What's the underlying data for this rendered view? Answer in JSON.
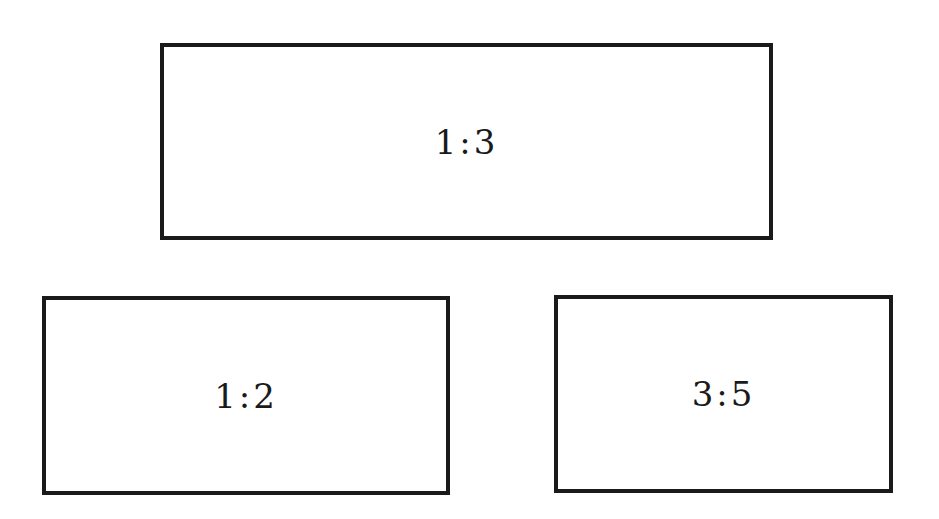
{
  "diagram": {
    "rectangles": [
      {
        "id": "ratio-1-3",
        "label": "1:3",
        "x": 160,
        "y": 43,
        "width": 613,
        "height": 197
      },
      {
        "id": "ratio-1-2",
        "label": "1:2",
        "x": 42,
        "y": 296,
        "width": 408,
        "height": 199
      },
      {
        "id": "ratio-3-5",
        "label": "3:5",
        "x": 554,
        "y": 295,
        "width": 339,
        "height": 198
      }
    ],
    "colors": {
      "stroke": "#1a1a1a",
      "background": "#ffffff"
    }
  }
}
